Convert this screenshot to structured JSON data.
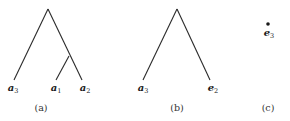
{
  "panels": [
    {
      "caption": "(a)",
      "leaves": [
        {
          "base": "a",
          "sub": "3"
        },
        {
          "base": "a",
          "sub": "1"
        },
        {
          "base": "a",
          "sub": "2"
        }
      ]
    },
    {
      "caption": "(b)",
      "leaves": [
        {
          "base": "a",
          "sub": "3"
        },
        {
          "base": "e",
          "sub": "2"
        }
      ]
    },
    {
      "caption": "(c)",
      "leaves": [
        {
          "base": "e",
          "sub": "3"
        }
      ]
    }
  ],
  "colors": {
    "edge": "#2a2a2a",
    "text": "#1a1a1a",
    "background": "#ffffff"
  }
}
